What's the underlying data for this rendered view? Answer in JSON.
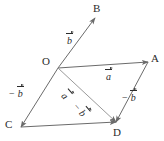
{
  "figure": {
    "type": "vector-parallelogram-diagram",
    "width": 164,
    "height": 141,
    "background_color": "#ffffff",
    "line_color": "#6b6b6b",
    "text_color": "#2b2b2b"
  },
  "points": [
    {
      "id": "O",
      "label": "O",
      "x": 58,
      "y": 68,
      "label_x": 42,
      "label_y": 56
    },
    {
      "id": "A",
      "label": "A",
      "x": 148,
      "y": 62,
      "label_x": 151,
      "label_y": 53
    },
    {
      "id": "B",
      "label": "B",
      "x": 95,
      "y": 18,
      "label_x": 93,
      "label_y": 3
    },
    {
      "id": "C",
      "label": "C",
      "x": 21,
      "y": 127,
      "label_x": 5,
      "label_y": 119
    },
    {
      "id": "D",
      "label": "D",
      "x": 116,
      "y": 122,
      "label_x": 113,
      "label_y": 127
    }
  ],
  "segments": [
    {
      "id": "OB",
      "from": "O",
      "to": "B",
      "arrow": true,
      "note": "vector b from O toward B"
    },
    {
      "id": "OA",
      "from": "O",
      "to": "A",
      "arrow": true,
      "note": "vector a from O to A"
    },
    {
      "id": "OC",
      "from": "O",
      "to": "C",
      "arrow": true,
      "note": "vector minus b from O to C"
    },
    {
      "id": "AD",
      "from": "A",
      "to": "D",
      "arrow": true,
      "note": "vector minus b from A to D"
    },
    {
      "id": "CD",
      "from": "C",
      "to": "D",
      "arrow": true,
      "note": "bottom edge from C to D"
    },
    {
      "id": "OD",
      "from": "O",
      "to": "D",
      "arrow": true,
      "note": "diagonal a minus b from O to D"
    }
  ],
  "vector_labels": [
    {
      "id": "b-upper",
      "minus": "",
      "letter": "b",
      "x": 64,
      "y": 36,
      "rotation": 0,
      "for_segment": "OB"
    },
    {
      "id": "a-top",
      "minus": "",
      "letter": "a",
      "x": 103,
      "y": 72,
      "rotation": 0,
      "for_segment": "OA"
    },
    {
      "id": "minus-b-left",
      "minus": "−",
      "letter": "b",
      "x": 9,
      "y": 89,
      "rotation": 0,
      "for_segment": "OC"
    },
    {
      "id": "minus-b-right",
      "minus": "−",
      "letter": "b",
      "x": 122,
      "y": 93,
      "rotation": 0,
      "for_segment": "AD"
    },
    {
      "id": "a-diagonal",
      "minus": "",
      "letter": "a",
      "x": 61,
      "y": 87,
      "rotation": 49,
      "for_segment": "OD"
    },
    {
      "id": "minus-b-diagonal",
      "minus": "−",
      "letter": "b",
      "x": 75,
      "y": 100,
      "rotation": 49,
      "for_segment": "OD"
    }
  ]
}
